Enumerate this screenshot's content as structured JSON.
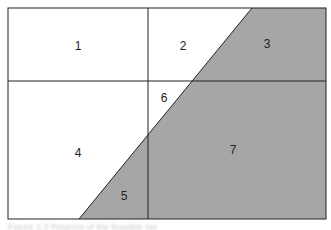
{
  "diagram": {
    "colors": {
      "shaded": "#a6a6a6",
      "line": "#222222",
      "background": "#ffffff"
    },
    "regions": [
      {
        "id": "1",
        "label": "1",
        "x": 78,
        "y": 46
      },
      {
        "id": "2",
        "label": "2",
        "x": 183,
        "y": 46
      },
      {
        "id": "3",
        "label": "3",
        "x": 267,
        "y": 44
      },
      {
        "id": "4",
        "label": "4",
        "x": 78,
        "y": 153
      },
      {
        "id": "5",
        "label": "5",
        "x": 124,
        "y": 196
      },
      {
        "id": "6",
        "label": "6",
        "x": 164,
        "y": 98
      },
      {
        "id": "7",
        "label": "7",
        "x": 233,
        "y": 150
      }
    ]
  },
  "caption": "Figure 2.3  Regions of the feasible set"
}
